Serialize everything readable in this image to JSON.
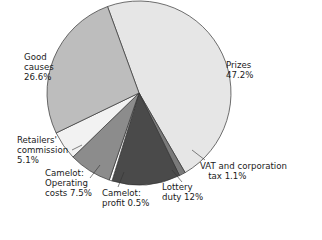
{
  "chart_data": {
    "type": "pie",
    "title": "",
    "start_angle_deg": -20,
    "slices": [
      {
        "label": "Prizes",
        "value": 47.2,
        "color": "#e6e6e6"
      },
      {
        "label": "VAT and corporation tax",
        "value": 1.1,
        "color": "#7a7a7a"
      },
      {
        "label": "Lottery duty",
        "value": 12.0,
        "color": "#4a4a4a"
      },
      {
        "label": "Camelot: profit",
        "value": 0.5,
        "color": "#ffffff"
      },
      {
        "label": "Camelot: Operating costs",
        "value": 7.5,
        "color": "#8c8c8c"
      },
      {
        "label": "Retailers' commission",
        "value": 5.1,
        "color": "#f2f2f2"
      },
      {
        "label": "Good causes",
        "value": 26.6,
        "color": "#bdbdbd"
      }
    ]
  },
  "labels": {
    "prizes": "Prizes\n47.2%",
    "vat": "VAT and corporation\n   tax 1.1%",
    "lottery": "Lottery\nduty 12%",
    "profit": "Camelot:\nprofit 0.5%",
    "operating": "Camelot:\nOperating\ncosts 7.5%",
    "retailers": "Retailers'\ncommission\n5.1%",
    "good": "Good\ncauses\n26.6%"
  }
}
